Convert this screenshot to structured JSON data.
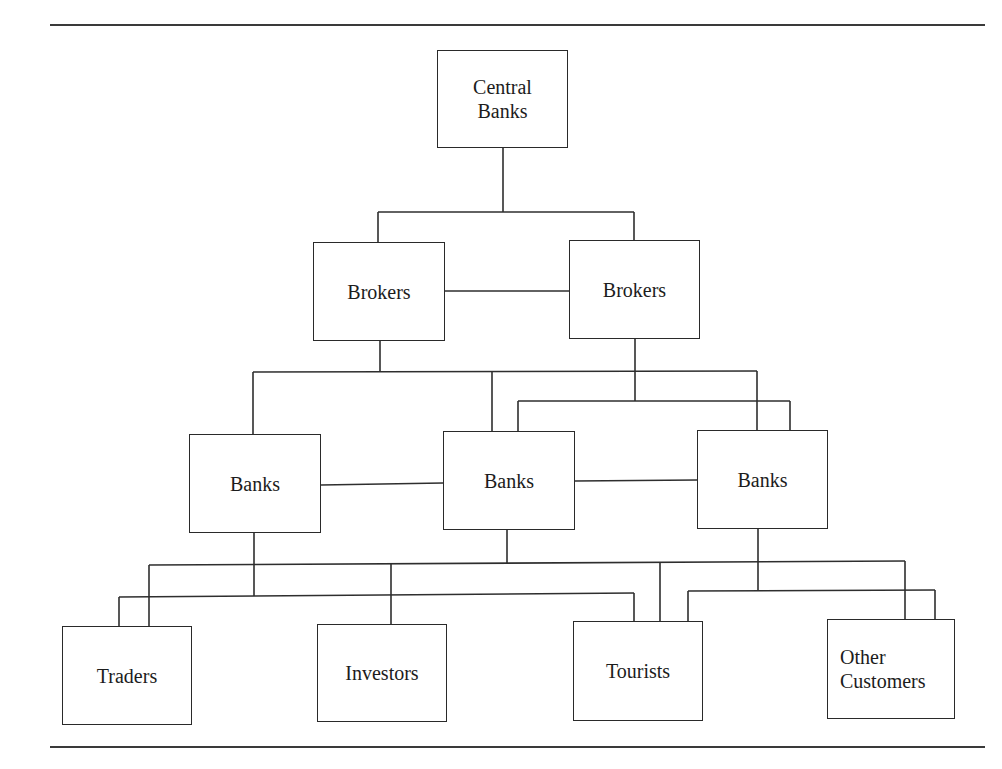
{
  "page": {
    "top_cutoff_text": "",
    "top_rule": {
      "x": 50,
      "y": 24,
      "w": 935
    },
    "bottom_rule": {
      "x": 50,
      "y": 746,
      "w": 935
    }
  },
  "diagram": {
    "title": "",
    "nodes": [
      {
        "id": "central-banks",
        "label": "Central\nBanks",
        "x": 437,
        "y": 50,
        "w": 131,
        "h": 98
      },
      {
        "id": "brokers-left",
        "label": "Brokers",
        "x": 313,
        "y": 242,
        "w": 132,
        "h": 99
      },
      {
        "id": "brokers-right",
        "label": "Brokers",
        "x": 569,
        "y": 240,
        "w": 131,
        "h": 99
      },
      {
        "id": "banks-left",
        "label": "Banks",
        "x": 189,
        "y": 434,
        "w": 132,
        "h": 99
      },
      {
        "id": "banks-middle",
        "label": "Banks",
        "x": 443,
        "y": 431,
        "w": 132,
        "h": 99
      },
      {
        "id": "banks-right",
        "label": "Banks",
        "x": 697,
        "y": 430,
        "w": 131,
        "h": 99
      },
      {
        "id": "traders",
        "label": "Traders",
        "x": 62,
        "y": 626,
        "w": 130,
        "h": 99
      },
      {
        "id": "investors",
        "label": "Investors",
        "x": 317,
        "y": 624,
        "w": 130,
        "h": 98
      },
      {
        "id": "tourists",
        "label": "Tourists",
        "x": 573,
        "y": 621,
        "w": 130,
        "h": 100
      },
      {
        "id": "other-customers",
        "label": "Other\nCustomers",
        "x": 827,
        "y": 619,
        "w": 128,
        "h": 100,
        "align": "left"
      }
    ],
    "edges": [
      {
        "from": "central-banks",
        "to": "brokers-left"
      },
      {
        "from": "central-banks",
        "to": "brokers-right"
      },
      {
        "from": "brokers-left",
        "to": "brokers-right"
      },
      {
        "from": "brokers-left",
        "to": "banks-left"
      },
      {
        "from": "brokers-left",
        "to": "banks-middle"
      },
      {
        "from": "brokers-left",
        "to": "banks-right"
      },
      {
        "from": "brokers-right",
        "to": "banks-middle"
      },
      {
        "from": "brokers-right",
        "to": "banks-right"
      },
      {
        "from": "banks-left",
        "to": "banks-middle"
      },
      {
        "from": "banks-middle",
        "to": "banks-right"
      },
      {
        "from": "banks-middle",
        "to": "traders"
      },
      {
        "from": "banks-middle",
        "to": "investors"
      },
      {
        "from": "banks-middle",
        "to": "tourists"
      },
      {
        "from": "banks-middle",
        "to": "other-customers"
      },
      {
        "from": "banks-left",
        "to": "traders"
      },
      {
        "from": "banks-left",
        "to": "investors"
      },
      {
        "from": "banks-left",
        "to": "tourists"
      },
      {
        "from": "banks-right",
        "to": "tourists"
      },
      {
        "from": "banks-right",
        "to": "other-customers"
      }
    ],
    "segments": [
      [
        503,
        148,
        503,
        212
      ],
      [
        378,
        212,
        634,
        212
      ],
      [
        378,
        212,
        378,
        242
      ],
      [
        634,
        212,
        634,
        240
      ],
      [
        445,
        291,
        569,
        291
      ],
      [
        380,
        341,
        380,
        372
      ],
      [
        253,
        372,
        757,
        371
      ],
      [
        253,
        372,
        253,
        434
      ],
      [
        492,
        372,
        492,
        431
      ],
      [
        757,
        371,
        757,
        430
      ],
      [
        635,
        339,
        635,
        401
      ],
      [
        518,
        401,
        790,
        401
      ],
      [
        518,
        401,
        518,
        431
      ],
      [
        790,
        401,
        790,
        430
      ],
      [
        321,
        485,
        443,
        483
      ],
      [
        575,
        481,
        697,
        480
      ],
      [
        507,
        530,
        507,
        563
      ],
      [
        149,
        565,
        905,
        561
      ],
      [
        149,
        565,
        149,
        626
      ],
      [
        391,
        564,
        391,
        624
      ],
      [
        660,
        562,
        660,
        621
      ],
      [
        905,
        561,
        905,
        619
      ],
      [
        254,
        533,
        254,
        596
      ],
      [
        119,
        597,
        634,
        593
      ],
      [
        119,
        597,
        119,
        626
      ],
      [
        634,
        593,
        634,
        621
      ],
      [
        758,
        529,
        758,
        591
      ],
      [
        688,
        591,
        935,
        590
      ],
      [
        688,
        591,
        688,
        621
      ],
      [
        935,
        590,
        935,
        619
      ]
    ]
  },
  "colors": {
    "stroke": "#2a2a2a",
    "background": "#ffffff",
    "text": "#1c1c1c"
  }
}
